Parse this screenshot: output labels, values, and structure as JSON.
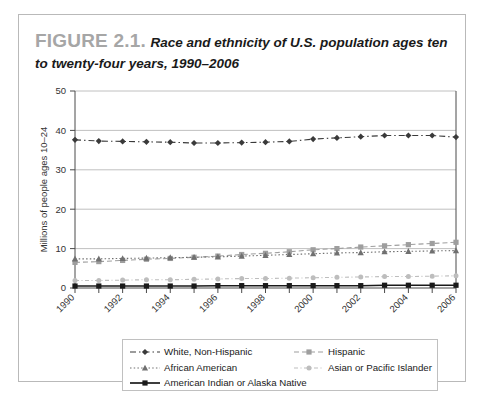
{
  "figure": {
    "label": "FIGURE 2.1.",
    "title": "Race and ethnicity of U.S. population ages ten to twenty-four years, 1990–2006"
  },
  "chart_data": {
    "type": "line",
    "title": "Race and ethnicity of U.S. population ages ten to twenty-four years, 1990–2006",
    "xlabel": "",
    "ylabel": "Millions of people ages 10–24",
    "x": [
      1990,
      1991,
      1992,
      1993,
      1994,
      1995,
      1996,
      1997,
      1998,
      1999,
      2000,
      2001,
      2002,
      2003,
      2004,
      2005,
      2006
    ],
    "xtick_labels": [
      "1990",
      "",
      "1992",
      "",
      "1994",
      "",
      "1996",
      "",
      "1998",
      "",
      "2000",
      "",
      "2002",
      "",
      "2004",
      "",
      "2006"
    ],
    "xlim": [
      1990,
      2006
    ],
    "ylim": [
      0,
      50
    ],
    "yticks": [
      0,
      10,
      20,
      30,
      40,
      50
    ],
    "ytick_labels": [
      "0",
      "10",
      "20",
      "30",
      "40",
      "50"
    ],
    "grid": true,
    "legend_position": "bottom",
    "series": [
      {
        "name": "White, Non-Hispanic",
        "marker": "diamond",
        "dash": "dash-dot",
        "color": "#3a3a3a",
        "values": [
          37.6,
          37.3,
          37.2,
          37.1,
          37.0,
          36.8,
          36.8,
          36.9,
          37.0,
          37.2,
          37.8,
          38.1,
          38.4,
          38.7,
          38.7,
          38.7,
          38.3
        ]
      },
      {
        "name": "Hispanic",
        "marker": "square",
        "dash": "dashed",
        "color": "#9e9e9e",
        "values": [
          6.5,
          6.7,
          7.0,
          7.3,
          7.5,
          7.8,
          8.1,
          8.5,
          8.8,
          9.2,
          9.7,
          10.0,
          10.4,
          10.7,
          11.0,
          11.3,
          11.6
        ]
      },
      {
        "name": "African American",
        "marker": "triangle",
        "dash": "dotted",
        "color": "#707070",
        "values": [
          7.4,
          7.4,
          7.5,
          7.6,
          7.7,
          7.8,
          7.9,
          8.1,
          8.3,
          8.5,
          8.7,
          8.9,
          9.0,
          9.2,
          9.3,
          9.4,
          9.5
        ]
      },
      {
        "name": "Asian or Pacific Islander",
        "marker": "circle",
        "dash": "dash-dot-light",
        "color": "#bdbdbd",
        "values": [
          1.9,
          1.9,
          2.0,
          2.1,
          2.1,
          2.2,
          2.3,
          2.4,
          2.4,
          2.5,
          2.6,
          2.7,
          2.8,
          2.9,
          2.9,
          3.0,
          3.1
        ]
      },
      {
        "name": "American Indian or Alaska Native",
        "marker": "square",
        "dash": "solid",
        "color": "#1a1a1a",
        "values": [
          0.5,
          0.5,
          0.5,
          0.5,
          0.5,
          0.5,
          0.6,
          0.6,
          0.6,
          0.6,
          0.6,
          0.6,
          0.6,
          0.7,
          0.7,
          0.7,
          0.7
        ]
      }
    ]
  },
  "legend": {
    "items": [
      {
        "label": "White, Non-Hispanic"
      },
      {
        "label": "Hispanic"
      },
      {
        "label": "African American"
      },
      {
        "label": "Asian or Pacific Islander"
      },
      {
        "label": "American Indian or Alaska Native"
      }
    ]
  }
}
